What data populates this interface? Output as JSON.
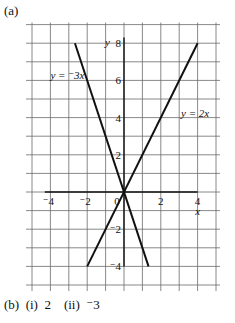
{
  "labels": {
    "part_a": "(a)",
    "part_b": "(b)  (i)  2    (ii)  ⁻3"
  },
  "chart_data": {
    "type": "line",
    "title": "",
    "xlabel": "x",
    "ylabel": "y",
    "xlim": [
      -5,
      5
    ],
    "ylim": [
      -5,
      9
    ],
    "grid": true,
    "x_ticks": [
      "⁻4",
      "⁻2",
      "0",
      "2",
      "4"
    ],
    "y_ticks": [
      "8",
      "6",
      "4",
      "2",
      "⁻2",
      "⁻4"
    ],
    "series": [
      {
        "name": "y = ⁻3x",
        "equation": "y = -3x",
        "points": [
          [
            -2.667,
            8
          ],
          [
            1.333,
            -4
          ]
        ]
      },
      {
        "name": "y = 2x",
        "equation": "y = 2x",
        "points": [
          [
            -2,
            -4
          ],
          [
            4,
            8
          ]
        ]
      }
    ],
    "annotations": [
      {
        "text": "y = ⁻3x",
        "near": [
          -3.6,
          6.2
        ]
      },
      {
        "text": "y = 2x",
        "near": [
          3.4,
          4.2
        ]
      }
    ]
  },
  "colors": {
    "grid": "#6a6a6a",
    "line": "#111111",
    "background": "#ffffff"
  }
}
